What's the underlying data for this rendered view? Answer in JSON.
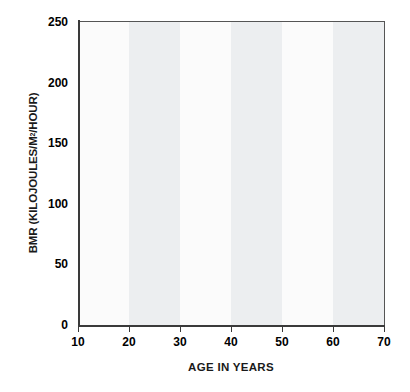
{
  "chart_data": {
    "type": "line",
    "title": "",
    "xlabel": "AGE IN YEARS",
    "ylabel": "BMR (KILOJOULES/M2/HOUR)",
    "ylabel_prefix": "BMR (KILOJOULES/M",
    "ylabel_superscript": "2",
    "ylabel_suffix": "/HOUR)",
    "xlim": [
      10,
      70
    ],
    "ylim": [
      0,
      250
    ],
    "xticks": [
      10,
      20,
      30,
      40,
      50,
      60,
      70
    ],
    "xtick_labels": [
      "10",
      "20",
      "30",
      "40",
      "50",
      "60",
      "70"
    ],
    "yticks": [
      0,
      50,
      100,
      150,
      200,
      250
    ],
    "ytick_labels": [
      "0",
      "50",
      "100",
      "150",
      "200",
      "250"
    ],
    "grid": false,
    "legend": "none",
    "background_bands": {
      "description": "alternating vertical shaded decades",
      "shaded_color": "#eceef0",
      "plain_color": "#fbfbfb",
      "shaded_intervals": [
        [
          20,
          30
        ],
        [
          40,
          50
        ],
        [
          60,
          70
        ]
      ]
    },
    "series": [
      {
        "name": "upper-curve",
        "color": "#4f4f4f",
        "x": [
          10,
          12,
          14,
          16,
          18,
          20,
          22,
          24,
          26,
          28,
          30,
          35,
          40,
          45,
          50,
          55,
          60,
          65,
          70
        ],
        "values": [
          218,
          211,
          203,
          195,
          186,
          176,
          171,
          170,
          169,
          169,
          169,
          169,
          168,
          167,
          166,
          165,
          164,
          162,
          161
        ]
      },
      {
        "name": "lower-curve",
        "color": "#4f4f4f",
        "x": [
          10,
          12,
          14,
          16,
          18,
          20,
          22,
          24,
          26,
          28,
          30,
          35,
          40,
          45,
          50,
          55,
          60,
          65,
          70
        ],
        "values": [
          210,
          203,
          195,
          187,
          178,
          168,
          164,
          162,
          160,
          159,
          158,
          156,
          154,
          153,
          151,
          150,
          149,
          147,
          146
        ]
      }
    ]
  }
}
